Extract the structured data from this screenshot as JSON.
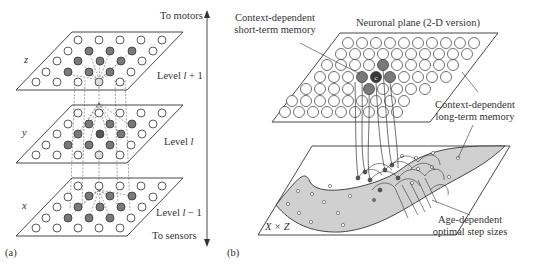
{
  "panel_a": {
    "tag": "(a)",
    "top_arrow_label": "To motors",
    "bottom_arrow_label": "To sensors",
    "levels": [
      {
        "var": "z",
        "label_prefix": "Level ",
        "label_italic": "l",
        "label_suffix": " + 1"
      },
      {
        "var": "y",
        "label_prefix": "Level ",
        "label_italic": "l",
        "label_suffix": ""
      },
      {
        "var": "x",
        "label_prefix": "Level ",
        "label_italic": "l",
        "label_suffix": " − 1"
      }
    ]
  },
  "panel_b": {
    "tag": "(b)",
    "title": "Neuronal plane (2-D version)",
    "stm_label_line1": "Context-dependent",
    "stm_label_line2": "short-term memory",
    "ltm_label_line1": "Context-dependent",
    "ltm_label_line2": "long-term memory",
    "step_label_line1": "Age-dependent",
    "step_label_line2": "optimal step sizes",
    "center_neuron": "c",
    "bottom_plane_label": "X × Z"
  },
  "colors": {
    "line": "#333333",
    "filled_neuron": "#7a7a7a",
    "center_neuron": "#3a3a3a",
    "manifold_fill": "#d0d0d0"
  }
}
